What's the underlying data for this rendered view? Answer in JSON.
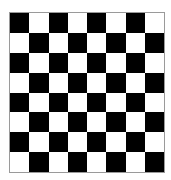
{
  "board": {
    "rows": 8,
    "cols": 8,
    "top_left": "dark",
    "colors": {
      "dark": "#000000",
      "light": "#ffffff",
      "border": "#9a9a9a"
    },
    "pieces": []
  }
}
